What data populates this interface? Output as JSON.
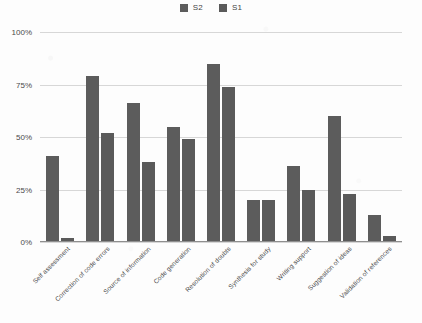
{
  "chart_data": {
    "type": "bar",
    "title": "",
    "subtitle": "",
    "xlabel": "",
    "ylabel": "",
    "ylim": [
      0,
      100
    ],
    "y_ticks": [
      "0%",
      "25%",
      "50%",
      "75%",
      "100%"
    ],
    "y_tick_values": [
      0,
      25,
      50,
      75,
      100
    ],
    "grid": true,
    "legend_position": "top-center",
    "categories": [
      "Self assessment",
      "Correction of code errors",
      "Source of information",
      "Code generation",
      "Resolution of doubts",
      "Synthesis for study",
      "Writing support",
      "Suggestion of ideas",
      "Validation of references"
    ],
    "series": [
      {
        "name": "S2",
        "color": "#5c5c5c",
        "values": [
          41,
          79,
          66,
          55,
          85,
          20,
          36,
          60,
          13
        ]
      },
      {
        "name": "S1",
        "color": "#5a5a5a",
        "values": [
          2,
          52,
          38,
          49,
          74,
          20,
          25,
          23,
          3
        ]
      }
    ]
  },
  "legend": {
    "items": [
      {
        "label": "S2",
        "color": "#5c5c5c",
        "swatch_icon": "square-swatch-icon"
      },
      {
        "label": "S1",
        "color": "#5a5a5a",
        "swatch_icon": "square-swatch-icon"
      }
    ]
  },
  "colors": {
    "background": "#fdfdfd",
    "gridline": "#d7d7d7",
    "axis": "#8f8f8f",
    "text": "#4a4a4a",
    "series_s2": "#5c5c5c",
    "series_s1": "#5a5a5a"
  }
}
